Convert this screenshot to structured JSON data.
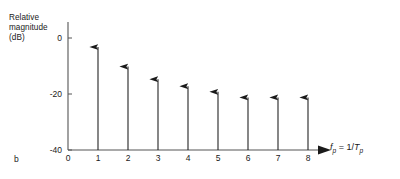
{
  "figure": {
    "letter": "b",
    "y_axis_label_lines": [
      "Relative",
      "magnitude",
      "(dB)"
    ],
    "x_axis_title": {
      "symbol": "f",
      "symbol_sub": "p",
      "equals": " = 1/",
      "denom": "T",
      "denom_sub": "p",
      "plain": "f_p = 1/T_p"
    },
    "line_color": "#1a1a1a",
    "axis_color": "#555555",
    "background": "#ffffff"
  },
  "chart_data": {
    "type": "bar",
    "title": "",
    "subtitle": "",
    "xlabel": "f_p = 1/T_p",
    "ylabel": "Relative magnitude (dB)",
    "categories": [
      "1",
      "2",
      "3",
      "4",
      "5",
      "6",
      "7",
      "8"
    ],
    "values": [
      0,
      -7,
      -11.5,
      -14,
      -16,
      -18,
      -18,
      -18
    ],
    "x": [
      1,
      2,
      3,
      4,
      5,
      6,
      7,
      8
    ],
    "xlim": [
      0,
      8.8
    ],
    "ylim": [
      -40,
      2
    ],
    "xticks": [
      "0",
      "1",
      "2",
      "3",
      "4",
      "5",
      "6",
      "7",
      "8"
    ],
    "yticks": [
      "0",
      "-20",
      "-40"
    ],
    "ytick_values": [
      0,
      -20,
      -40
    ],
    "grid": false,
    "legend": null,
    "legend_position": "none",
    "annotations": [
      "b"
    ],
    "marker": "upward-arrow-stem"
  }
}
